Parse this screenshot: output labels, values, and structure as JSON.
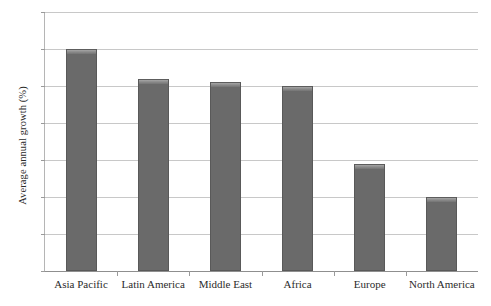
{
  "chart_data": {
    "type": "bar",
    "title": "",
    "subtitle": "",
    "xlabel": "",
    "ylabel": "Average annual growth (%)",
    "categories": [
      "Asia Pacific",
      "Latin America",
      "Middle East",
      "Africa",
      "Europe",
      "North America"
    ],
    "values": [
      6.0,
      5.2,
      5.1,
      5.0,
      2.9,
      2.0
    ],
    "ylim": [
      0,
      7
    ],
    "ytick_labels": [
      "0",
      "1",
      "2",
      "3",
      "4",
      "5",
      "6",
      "7"
    ],
    "ytick_values": [
      0,
      1,
      2,
      3,
      4,
      5,
      6,
      7
    ],
    "grid": true,
    "grid_axis": "y",
    "legend": false,
    "legend_position": "none",
    "bar_color": "#6a6a6a",
    "bar_edge_color": "#595959",
    "gridline_color": "#c8c8c8",
    "axis_color": "#8f8f8f",
    "text_color": "#2b2b2b",
    "background": "#ffffff"
  }
}
